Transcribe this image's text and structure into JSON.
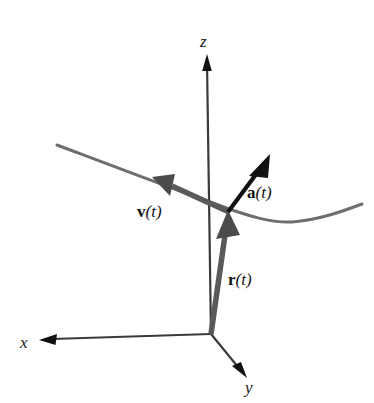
{
  "figure": {
    "title": "",
    "background_color": "#ffffff",
    "axis_color": "#3a3a3a",
    "curve_color": "#6e6e6e",
    "vector_color": "#5a5a5a",
    "accel_vector_color": "#111111",
    "label_color": "#111111"
  },
  "axes": [
    {
      "id": "z",
      "label": "z",
      "style": "italic",
      "label_x": 206,
      "label_y": 41,
      "from": [
        211,
        334
      ],
      "to": [
        207,
        56
      ],
      "arrow": "tip"
    },
    {
      "id": "x",
      "label": "x",
      "style": "italic",
      "label_x": 22,
      "label_y": 348,
      "from": [
        211,
        334
      ],
      "to": [
        41,
        340
      ],
      "arrow": "tip"
    },
    {
      "id": "y",
      "label": "y",
      "style": "italic",
      "label_x": 245,
      "label_y": 392,
      "from": [
        211,
        334
      ],
      "to": [
        245,
        376
      ],
      "arrow": "tip"
    }
  ],
  "curve": {
    "name": "space-curve",
    "start": [
      57,
      145
    ],
    "end": [
      362,
      204
    ],
    "points": [
      [
        57,
        145
      ],
      [
        110,
        165
      ],
      [
        160,
        184
      ],
      [
        200,
        199
      ],
      [
        228,
        211
      ],
      [
        258,
        219
      ],
      [
        290,
        222
      ],
      [
        322,
        216
      ],
      [
        348,
        208
      ],
      [
        362,
        204
      ]
    ]
  },
  "vectors": [
    {
      "id": "r",
      "name": "position-vector",
      "label_bold": "r",
      "label_rest": "(t)",
      "label_x": 228,
      "label_y": 284,
      "from": [
        211,
        334
      ],
      "to": [
        228,
        212
      ],
      "width": 5,
      "color": "#5a5a5a"
    },
    {
      "id": "v",
      "name": "velocity-vector",
      "label_bold": "v",
      "label_rest": "(t)",
      "label_x": 139,
      "label_y": 216,
      "from": [
        228,
        211
      ],
      "to": [
        153,
        177
      ],
      "width": 5,
      "color": "#5a5a5a"
    },
    {
      "id": "a",
      "name": "acceleration-vector",
      "label_bold": "a",
      "label_rest": "(t)",
      "label_x": 247,
      "label_y": 197,
      "from": [
        228,
        211
      ],
      "to": [
        269,
        156
      ],
      "width": 4,
      "color": "#111111"
    }
  ],
  "point_of_tangency": {
    "name": "curve-point",
    "x": 228,
    "y": 211
  }
}
